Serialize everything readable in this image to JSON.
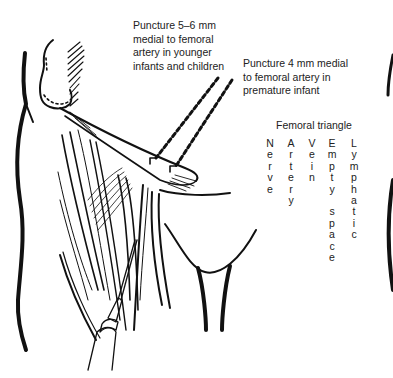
{
  "figure": {
    "labels": {
      "older": [
        "Puncture 5–6 mm",
        "medial to femoral",
        "artery in younger",
        "infants and children"
      ],
      "premature": [
        "Puncture 4 mm medial",
        "to femoral artery in",
        "premature infant"
      ]
    },
    "femoral_triangle": {
      "title": "Femoral triangle",
      "columns": [
        {
          "word": "Nerve",
          "letters": [
            "N",
            "e",
            "r",
            "v",
            "e"
          ]
        },
        {
          "word": "Artery",
          "letters": [
            "A",
            "r",
            "t",
            "e",
            "r",
            "y"
          ]
        },
        {
          "word": "Vein",
          "letters": [
            "V",
            "e",
            "i",
            "n"
          ]
        },
        {
          "word": "Empty space",
          "letters": [
            "E",
            "m",
            "p",
            "t",
            "y",
            "",
            "s",
            "p",
            "a",
            "c",
            "e"
          ]
        },
        {
          "word": "Lymphatic",
          "letters": [
            "L",
            "y",
            "m",
            "p",
            "h",
            "a",
            "t",
            "i",
            "c"
          ]
        }
      ]
    },
    "colors": {
      "ink": "#111111",
      "text": "#222222",
      "background": "#ffffff"
    }
  }
}
